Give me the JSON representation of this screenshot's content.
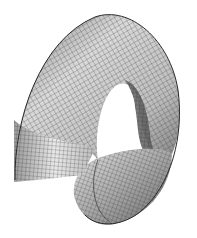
{
  "figure": {
    "type": "3d-mesh-surface",
    "colors": {
      "background": "#ffffff",
      "surface_light": "#e6e6e6",
      "surface_mid": "#b4b4b4",
      "surface_dark": "#6e6e6e",
      "mesh_line": "#3a3a3a"
    }
  }
}
